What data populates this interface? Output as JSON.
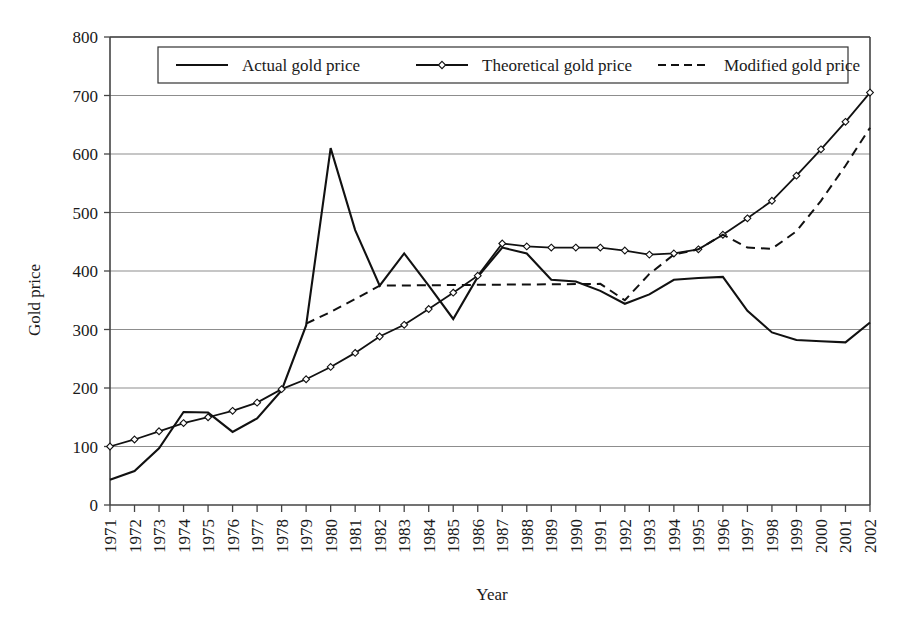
{
  "chart_data": {
    "type": "line",
    "title": "",
    "xlabel": "Year",
    "ylabel": "Gold price",
    "ylim": [
      0,
      800
    ],
    "ytick_step": 100,
    "yticks": [
      0,
      100,
      200,
      300,
      400,
      500,
      600,
      700,
      800
    ],
    "grid": "horizontal",
    "legend_position": "top-inside",
    "categories": [
      "1971",
      "1972",
      "1973",
      "1974",
      "1975",
      "1976",
      "1977",
      "1978",
      "1979",
      "1980",
      "1981",
      "1982",
      "1983",
      "1984",
      "1985",
      "1986",
      "1987",
      "1988",
      "1989",
      "1990",
      "1991",
      "1992",
      "1993",
      "1994",
      "1995",
      "1996",
      "1997",
      "1998",
      "1999",
      "2000",
      "2001",
      "2002"
    ],
    "series": [
      {
        "name": "Actual gold price",
        "style": "solid",
        "markers": false,
        "values": [
          43,
          58,
          97,
          159,
          158,
          125,
          148,
          196,
          307,
          610,
          470,
          375,
          430,
          375,
          318,
          390,
          440,
          430,
          385,
          382,
          366,
          344,
          360,
          385,
          388,
          390,
          332,
          295,
          282,
          280,
          278,
          312
        ]
      },
      {
        "name": "Theoretical gold price",
        "style": "solid",
        "markers": true,
        "values": [
          100,
          112,
          126,
          140,
          150,
          161,
          175,
          198,
          215,
          236,
          260,
          288,
          308,
          335,
          363,
          392,
          447,
          442,
          440,
          440,
          440,
          435,
          428,
          430,
          437,
          462,
          490,
          520,
          563,
          608,
          655,
          705
        ]
      },
      {
        "name": "Modified gold price",
        "style": "dashed",
        "markers": false,
        "start_index": 8,
        "values": [
          null,
          null,
          null,
          null,
          null,
          null,
          null,
          null,
          310,
          330,
          352,
          375,
          null,
          null,
          null,
          null,
          null,
          null,
          null,
          null,
          378,
          350,
          395,
          428,
          437,
          462,
          440,
          438,
          468,
          520,
          580,
          645
        ]
      }
    ]
  },
  "legend": {
    "entries": [
      {
        "label": "Actual gold price",
        "style": "solid",
        "marker": false
      },
      {
        "label": "Theoretical gold price",
        "style": "solid",
        "marker": true
      },
      {
        "label": "Modified gold price",
        "style": "dashed",
        "marker": false
      }
    ]
  },
  "axes": {
    "y_title": "Gold price",
    "x_title": "Year",
    "y_tick_labels": [
      "800",
      "700",
      "600",
      "500",
      "400",
      "300",
      "200",
      "100",
      "0"
    ],
    "x_tick_labels": [
      "1971",
      "1972",
      "1973",
      "1974",
      "1975",
      "1976",
      "1977",
      "1978",
      "1979",
      "1980",
      "1981",
      "1982",
      "1983",
      "1984",
      "1985",
      "1986",
      "1987",
      "1988",
      "1989",
      "1990",
      "1991",
      "1992",
      "1993",
      "1994",
      "1995",
      "1996",
      "1997",
      "1998",
      "1999",
      "2000",
      "2001",
      "2002"
    ]
  }
}
